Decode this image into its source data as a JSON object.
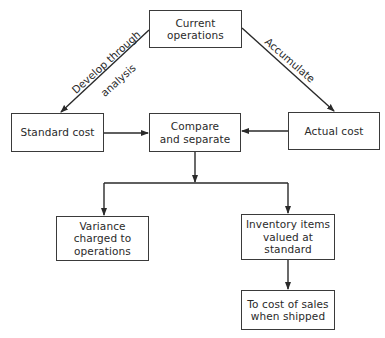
{
  "diagram": {
    "type": "flowchart",
    "nodes": [
      {
        "id": "current",
        "label": "Current\noperations"
      },
      {
        "id": "standard",
        "label": "Standard cost"
      },
      {
        "id": "compare",
        "label": "Compare\nand separate"
      },
      {
        "id": "actual",
        "label": "Actual cost"
      },
      {
        "id": "variance",
        "label": "Variance\ncharged to\noperations"
      },
      {
        "id": "inventory",
        "label": "Inventory items\nvalued at\nstandard"
      },
      {
        "id": "cost_of_sales",
        "label": "To cost of sales\nwhen shipped"
      }
    ],
    "edges": [
      {
        "from": "current",
        "to": "standard",
        "label_line1": "Develop through",
        "label_line2": "analysis"
      },
      {
        "from": "current",
        "to": "actual",
        "label": "Accumulate"
      },
      {
        "from": "standard",
        "to": "compare",
        "label": ""
      },
      {
        "from": "actual",
        "to": "compare",
        "label": ""
      },
      {
        "from": "compare",
        "to": "variance",
        "label": ""
      },
      {
        "from": "compare",
        "to": "inventory",
        "label": ""
      },
      {
        "from": "inventory",
        "to": "cost_of_sales",
        "label": ""
      }
    ],
    "colors": {
      "line": "#2a2a2a",
      "border": "#3a3a3a",
      "background": "#ffffff"
    }
  }
}
